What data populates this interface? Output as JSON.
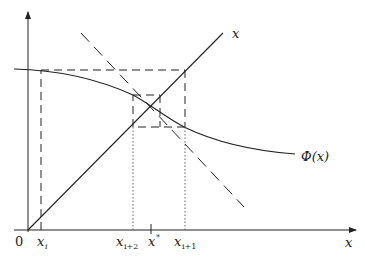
{
  "diagram": {
    "axes": {
      "origin_label": "0",
      "x_axis_label": "x",
      "diagonal_label": "x",
      "curve_label": "Φ(x)"
    },
    "x_ticks": {
      "x_i": {
        "base": "x",
        "sub": "i"
      },
      "x_i2": {
        "base": "x",
        "sub": "i+2"
      },
      "x_star": {
        "base": "x",
        "sup": "*"
      },
      "x_i1": {
        "base": "x",
        "sub": "i+1"
      }
    },
    "elements": [
      "y-axis with arrow",
      "x-axis with arrow",
      "diagonal line y = x",
      "curve Φ(x) (solid)",
      "tangent-like dashed line through fixed point",
      "dashed cobweb path",
      "dotted guide lines to x-axis"
    ],
    "colors": {
      "stroke": "#222222",
      "background": "#ffffff"
    }
  }
}
